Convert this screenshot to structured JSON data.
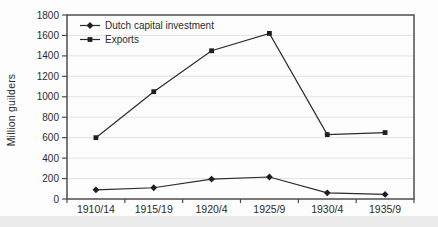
{
  "figure": {
    "background_color": "#fdfdfd",
    "page_strip_color": "#ececec"
  },
  "chart_data": {
    "type": "line",
    "title": "",
    "xlabel": "",
    "ylabel": "Million guilders",
    "categories": [
      "1910/14",
      "1915/19",
      "1920/4",
      "1925/9",
      "1930/4",
      "1935/9"
    ],
    "series": [
      {
        "name": "Dutch capital investment",
        "marker": "diamond",
        "values": [
          90,
          110,
          195,
          215,
          60,
          45
        ]
      },
      {
        "name": "Exports",
        "marker": "square",
        "values": [
          600,
          1050,
          1450,
          1620,
          630,
          650
        ]
      }
    ],
    "ylim": [
      0,
      1800
    ],
    "yticks": [
      0,
      200,
      400,
      600,
      800,
      1000,
      1200,
      1400,
      1600,
      1800
    ],
    "grid": "horizontal-faint",
    "legend_position": "top-left-inside",
    "line_color": "#2b2b2b",
    "marker_color": "#1e1e1e",
    "grid_color": "#e3e3e3",
    "axis_color": "#4d4d4d",
    "text_color": "#2b2b2b"
  }
}
